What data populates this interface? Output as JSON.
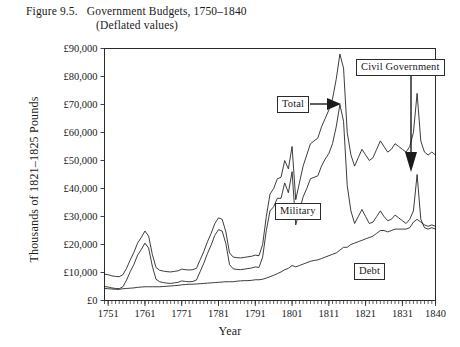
{
  "figure": {
    "number_label": "Figure 9.5.",
    "title": "Government Budgets, 1750–1840",
    "subtitle": "(Deflated values)"
  },
  "axes": {
    "ylabel": "Thousands of 1821–1825 Pounds",
    "xlabel": "Year",
    "ytick_labels": [
      "£90,000",
      "£80,000",
      "£70,000",
      "£60,000",
      "£50,000",
      "£40,000",
      "£30,000",
      "£20,000",
      "£10,000",
      "£0"
    ],
    "xtick_labels": [
      "1751",
      "1761",
      "1771",
      "1781",
      "1791",
      "1801",
      "1811",
      "1821",
      "1831",
      "1840"
    ]
  },
  "annotations": [
    {
      "name": "total",
      "text": "Total",
      "arrow": "right"
    },
    {
      "name": "civil-government",
      "text": "Civil Government",
      "arrow": "down"
    },
    {
      "name": "military",
      "text": "Military",
      "arrow": "none"
    },
    {
      "name": "debt",
      "text": "Debt",
      "arrow": "none"
    }
  ],
  "chart_data": {
    "type": "line",
    "title": "Government Budgets, 1750–1840 (Deflated values)",
    "xlabel": "Year",
    "ylabel": "Thousands of 1821–1825 Pounds",
    "xlim": [
      1750,
      1840
    ],
    "ylim": [
      0,
      90000
    ],
    "ytick_step": 10000,
    "grid": false,
    "legend_position": "inline-callouts",
    "x": [
      1750,
      1751,
      1752,
      1753,
      1754,
      1755,
      1756,
      1757,
      1758,
      1759,
      1760,
      1761,
      1762,
      1763,
      1764,
      1765,
      1766,
      1767,
      1768,
      1769,
      1770,
      1771,
      1772,
      1773,
      1774,
      1775,
      1776,
      1777,
      1778,
      1779,
      1780,
      1781,
      1782,
      1783,
      1784,
      1785,
      1786,
      1787,
      1788,
      1789,
      1790,
      1791,
      1792,
      1793,
      1794,
      1795,
      1796,
      1797,
      1798,
      1799,
      1800,
      1801,
      1802,
      1803,
      1804,
      1805,
      1806,
      1807,
      1808,
      1809,
      1810,
      1811,
      1812,
      1813,
      1814,
      1815,
      1816,
      1817,
      1818,
      1819,
      1820,
      1821,
      1822,
      1823,
      1824,
      1825,
      1826,
      1827,
      1828,
      1829,
      1830,
      1831,
      1832,
      1833,
      1834,
      1835,
      1836,
      1837,
      1838,
      1839,
      1840
    ],
    "series": [
      {
        "name": "Total",
        "values": [
          9400,
          9200,
          8800,
          8600,
          8500,
          9200,
          11500,
          14500,
          17200,
          20500,
          22500,
          24800,
          23000,
          16500,
          11800,
          10800,
          10500,
          10300,
          10200,
          10400,
          10600,
          11200,
          11000,
          10900,
          11000,
          11500,
          14500,
          17500,
          21000,
          24000,
          27500,
          29500,
          29000,
          24500,
          17000,
          15500,
          15300,
          15200,
          15400,
          15600,
          15800,
          16200,
          16000,
          20000,
          30000,
          38000,
          40000,
          43500,
          44000,
          50000,
          47000,
          55000,
          36000,
          42000,
          48000,
          52000,
          56000,
          57000,
          58000,
          62000,
          65000,
          68000,
          72000,
          79000,
          88000,
          83000,
          60000,
          52000,
          48000,
          51000,
          54000,
          52000,
          50000,
          51000,
          54000,
          57000,
          55000,
          53000,
          54000,
          56000,
          55000,
          54000,
          53000,
          55000,
          60000,
          74000,
          57000,
          53000,
          52000,
          53000,
          52000
        ]
      },
      {
        "name": "Military",
        "values": [
          5000,
          4800,
          4500,
          4300,
          4200,
          4900,
          7300,
          10300,
          12900,
          16200,
          18200,
          20500,
          18700,
          12300,
          7600,
          6700,
          6400,
          6200,
          6100,
          6300,
          6500,
          7000,
          6800,
          6700,
          6800,
          7300,
          10300,
          13300,
          16800,
          19800,
          23300,
          25300,
          24800,
          20300,
          12800,
          11300,
          11100,
          11000,
          11200,
          11400,
          11600,
          12000,
          11800,
          15500,
          25000,
          32000,
          33500,
          36500,
          36500,
          42000,
          38500,
          46000,
          27000,
          32000,
          37000,
          40000,
          43500,
          44000,
          44500,
          48000,
          50500,
          52500,
          56000,
          62000,
          70000,
          64000,
          41000,
          32000,
          27500,
          30000,
          32500,
          30000,
          27500,
          28000,
          30000,
          32000,
          30000,
          28500,
          29000,
          30500,
          29500,
          28500,
          27500,
          29000,
          32000,
          45000,
          29000,
          26000,
          25500,
          26000,
          25500
        ]
      },
      {
        "name": "Civil Government",
        "values": [
          4300,
          4200,
          4100,
          4000,
          4000,
          4200,
          4300,
          4400,
          4500,
          4700,
          4800,
          4900,
          4900,
          4900,
          4900,
          4900,
          5000,
          5100,
          5200,
          5300,
          5400,
          5600,
          5700,
          5800,
          5800,
          5900,
          6000,
          6100,
          6200,
          6300,
          6400,
          6500,
          6600,
          6700,
          6700,
          6700,
          6900,
          7000,
          7100,
          7100,
          7200,
          7400,
          7400,
          7600,
          8000,
          8500,
          9000,
          9600,
          10200,
          11000,
          11500,
          12500,
          12000,
          12500,
          13000,
          13500,
          14000,
          14300,
          14500,
          15000,
          15500,
          16000,
          16500,
          17000,
          18000,
          19000,
          19000,
          20000,
          20500,
          21000,
          21500,
          22000,
          22500,
          23000,
          24000,
          25000,
          25000,
          24500,
          25000,
          25500,
          25500,
          25500,
          25500,
          26000,
          28000,
          29000,
          28000,
          27000,
          26500,
          27000,
          26500
        ]
      }
    ],
    "annotated_peaks": [
      {
        "year": 1762,
        "series": "Total",
        "value": 24800,
        "event": "Seven Years' War peak"
      },
      {
        "year": 1781,
        "series": "Total",
        "value": 29500,
        "event": "American War peak"
      },
      {
        "year": 1814,
        "series": "Total",
        "value": 88000,
        "event": "Napoleonic Wars peak"
      },
      {
        "year": 1835,
        "series": "Total",
        "value": 74000,
        "event": "Late spike"
      }
    ]
  }
}
